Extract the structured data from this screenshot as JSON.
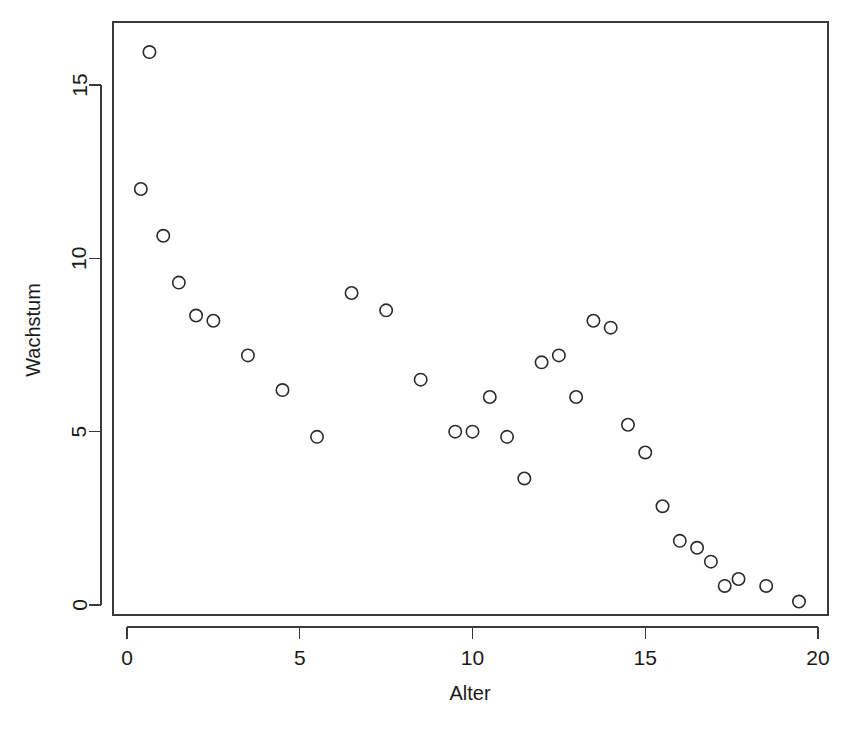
{
  "chart_data": {
    "type": "scatter",
    "title": "",
    "xlabel": "Alter",
    "ylabel": "Wachstum",
    "xlim": [
      -0.35,
      20.4
    ],
    "ylim": [
      -0.45,
      16.6
    ],
    "xticks": [
      0,
      5,
      10,
      15,
      20
    ],
    "xticklabels": [
      "0",
      "5",
      "10",
      "15",
      "20"
    ],
    "yticks": [
      0,
      5,
      10,
      15
    ],
    "yticklabels": [
      "0",
      "5",
      "10",
      "15"
    ],
    "grid": false,
    "legend": null,
    "marker": "open-circle",
    "marker_color": "#2b2b2b",
    "box_frame": true,
    "n_points": 36,
    "x": [
      0.4,
      0.65,
      1.05,
      1.5,
      2.0,
      2.5,
      3.5,
      4.5,
      5.5,
      6.5,
      7.5,
      8.5,
      9.5,
      10.0,
      10.5,
      11.0,
      11.5,
      12.0,
      12.5,
      13.0,
      13.5,
      14.0,
      14.5,
      15.0,
      15.5,
      16.0,
      16.5,
      16.9,
      17.3,
      17.7,
      18.5,
      19.45
    ],
    "y": [
      12.0,
      15.95,
      10.65,
      9.3,
      8.35,
      8.2,
      7.2,
      6.2,
      4.85,
      9.0,
      8.5,
      6.5,
      5.0,
      5.0,
      6.0,
      4.85,
      3.65,
      7.0,
      7.2,
      6.0,
      8.2,
      8.0,
      5.2,
      4.4,
      2.85,
      1.85,
      1.65,
      1.25,
      0.55,
      0.75,
      0.55,
      0.1
    ],
    "points": [
      {
        "x": 0.4,
        "y": 12.0
      },
      {
        "x": 0.65,
        "y": 15.95
      },
      {
        "x": 1.05,
        "y": 10.65
      },
      {
        "x": 1.5,
        "y": 9.3
      },
      {
        "x": 2.0,
        "y": 8.35
      },
      {
        "x": 2.5,
        "y": 8.2
      },
      {
        "x": 3.5,
        "y": 7.2
      },
      {
        "x": 4.5,
        "y": 6.2
      },
      {
        "x": 5.5,
        "y": 4.85
      },
      {
        "x": 6.5,
        "y": 9.0
      },
      {
        "x": 7.5,
        "y": 8.5
      },
      {
        "x": 8.5,
        "y": 6.5
      },
      {
        "x": 9.5,
        "y": 5.0
      },
      {
        "x": 10.0,
        "y": 5.0
      },
      {
        "x": 10.5,
        "y": 6.0
      },
      {
        "x": 11.0,
        "y": 4.85
      },
      {
        "x": 11.5,
        "y": 3.65
      },
      {
        "x": 12.0,
        "y": 7.0
      },
      {
        "x": 12.5,
        "y": 7.2
      },
      {
        "x": 13.0,
        "y": 6.0
      },
      {
        "x": 13.5,
        "y": 8.2
      },
      {
        "x": 14.0,
        "y": 8.0
      },
      {
        "x": 14.5,
        "y": 5.2
      },
      {
        "x": 15.0,
        "y": 4.4
      },
      {
        "x": 15.5,
        "y": 2.85
      },
      {
        "x": 16.0,
        "y": 1.85
      },
      {
        "x": 16.5,
        "y": 1.65
      },
      {
        "x": 16.9,
        "y": 1.25
      },
      {
        "x": 17.3,
        "y": 0.55
      },
      {
        "x": 17.7,
        "y": 0.75
      },
      {
        "x": 18.5,
        "y": 0.55
      },
      {
        "x": 19.45,
        "y": 0.1
      }
    ]
  },
  "figure": {
    "background_color": "#ffffff",
    "axis_color": "#3a3a3a",
    "point_color": "#2b2b2b"
  }
}
